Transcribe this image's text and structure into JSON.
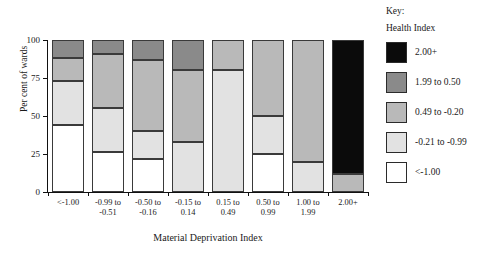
{
  "chart_data": {
    "type": "bar",
    "subtype": "stacked-bar-100",
    "title": "",
    "xlabel": "Material Deprivation Index",
    "ylabel": "Per cent of wards",
    "ylim": [
      0,
      100
    ],
    "yticks": [
      0,
      25,
      50,
      75,
      100
    ],
    "ytick_labels": [
      "0",
      "25",
      "50",
      "75",
      "100"
    ],
    "grid": false,
    "legend_position": "right",
    "categories": [
      "<-1.00",
      "-0.99 to\n-0.51",
      "-0.50 to\n-0.16",
      "-0.15 to\n0.14",
      "0.15 to\n0.49",
      "0.50 to\n0.99",
      "1.00 to\n1.99",
      "2.00+"
    ],
    "series": [
      {
        "name": "<-1.00",
        "color": "#ffffff",
        "values": [
          44,
          26,
          22,
          0,
          0,
          25,
          0,
          0
        ]
      },
      {
        "name": "-0.21 to -0.99",
        "color": "#e2e2e2",
        "values": [
          29,
          29,
          18,
          33,
          80,
          25,
          20,
          0
        ]
      },
      {
        "name": "0.49 to -0.20",
        "color": "#b9b9b9",
        "values": [
          15,
          36,
          47,
          47,
          20,
          50,
          80,
          12
        ]
      },
      {
        "name": "1.99 to 0.50",
        "color": "#8a8a8a",
        "values": [
          12,
          9,
          13,
          20,
          0,
          0,
          0,
          0
        ]
      },
      {
        "name": "2.00+",
        "color": "#0b0b0b",
        "values": [
          0,
          0,
          0,
          0,
          0,
          0,
          0,
          88
        ]
      }
    ],
    "bars": [
      {
        "category": "<-1.00",
        "segments": [
          {
            "key": "lt_-1.00",
            "from": 0,
            "to": 44
          },
          {
            "key": "-0.21 to -0.99",
            "from": 44,
            "to": 73
          },
          {
            "key": "0.49 to -0.20",
            "from": 73,
            "to": 88
          },
          {
            "key": "1.99 to 0.50",
            "from": 88,
            "to": 100
          }
        ]
      },
      {
        "category": "-0.99 to -0.51",
        "segments": [
          {
            "key": "lt_-1.00",
            "from": 0,
            "to": 26
          },
          {
            "key": "-0.21 to -0.99",
            "from": 26,
            "to": 55
          },
          {
            "key": "0.49 to -0.20",
            "from": 55,
            "to": 91
          },
          {
            "key": "1.99 to 0.50",
            "from": 91,
            "to": 100
          }
        ]
      },
      {
        "category": "-0.50 to -0.16",
        "segments": [
          {
            "key": "lt_-1.00",
            "from": 0,
            "to": 22
          },
          {
            "key": "-0.21 to -0.99",
            "from": 22,
            "to": 40
          },
          {
            "key": "0.49 to -0.20",
            "from": 40,
            "to": 87
          },
          {
            "key": "1.99 to 0.50",
            "from": 87,
            "to": 100
          }
        ]
      },
      {
        "category": "-0.15 to 0.14",
        "segments": [
          {
            "key": "-0.21 to -0.99",
            "from": 0,
            "to": 33
          },
          {
            "key": "0.49 to -0.20",
            "from": 33,
            "to": 80
          },
          {
            "key": "1.99 to 0.50",
            "from": 80,
            "to": 100
          }
        ]
      },
      {
        "category": "0.15 to 0.49",
        "segments": [
          {
            "key": "-0.21 to -0.99",
            "from": 0,
            "to": 80
          },
          {
            "key": "0.49 to -0.20",
            "from": 80,
            "to": 100
          }
        ]
      },
      {
        "category": "0.50 to 0.99",
        "segments": [
          {
            "key": "lt_-1.00",
            "from": 0,
            "to": 25
          },
          {
            "key": "-0.21 to -0.99",
            "from": 25,
            "to": 50
          },
          {
            "key": "0.49 to -0.20",
            "from": 50,
            "to": 100
          }
        ]
      },
      {
        "category": "1.00 to 1.99",
        "segments": [
          {
            "key": "-0.21 to -0.99",
            "from": 0,
            "to": 20
          },
          {
            "key": "0.49 to -0.20",
            "from": 20,
            "to": 100
          }
        ]
      },
      {
        "category": "2.00+",
        "segments": [
          {
            "key": "0.49 to -0.20",
            "from": 0,
            "to": 12
          },
          {
            "key": "2.00+",
            "from": 12,
            "to": 100
          }
        ]
      }
    ]
  },
  "axes": {
    "y_title": "Per cent of wards",
    "x_title": "Material Deprivation Index",
    "y_ticks": [
      {
        "value": 0,
        "label": "0"
      },
      {
        "value": 25,
        "label": "25"
      },
      {
        "value": 50,
        "label": "50"
      },
      {
        "value": 75,
        "label": "75"
      },
      {
        "value": 100,
        "label": "100"
      }
    ],
    "x_ticks": [
      {
        "label": "<-1.00"
      },
      {
        "label": "-0.99 to\n-0.51"
      },
      {
        "label": "-0.50 to\n-0.16"
      },
      {
        "label": "-0.15 to\n0.14"
      },
      {
        "label": "0.15 to\n0.49"
      },
      {
        "label": "0.50 to\n0.99"
      },
      {
        "label": "1.00 to\n1.99"
      },
      {
        "label": "2.00+"
      }
    ]
  },
  "legend": {
    "title_line_1": "Key:",
    "title_line_2": "Health Index",
    "items": [
      {
        "label": "2.00+",
        "color": "#0b0b0b"
      },
      {
        "label": "1.99 to 0.50",
        "color": "#8a8a8a"
      },
      {
        "label": "0.49 to -0.20",
        "color": "#b9b9b9"
      },
      {
        "label": "-0.21 to -0.99",
        "color": "#e2e2e2"
      },
      {
        "label": "<-1.00",
        "color": "#ffffff"
      }
    ]
  },
  "colors": {
    "lt_-1.00": "#ffffff",
    "-0.21 to -0.99": "#e2e2e2",
    "0.49 to -0.20": "#b9b9b9",
    "1.99 to 0.50": "#8a8a8a",
    "2.00+": "#0b0b0b",
    "axis": "#111111",
    "segment_border": "#3a3a3a",
    "background": "#ffffff"
  }
}
